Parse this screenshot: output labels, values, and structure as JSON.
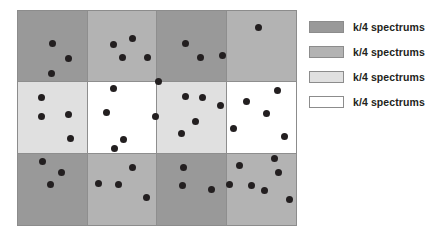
{
  "figure": {
    "name": "spectrum-partition-grid",
    "dot_color": "#231f20",
    "border_color": "#8c8c8c"
  },
  "palette": {
    "dark_gray": "#999999",
    "medium_gray": "#b3b3b3",
    "light_gray": "#e0e0e0",
    "white": "#ffffff"
  },
  "legend": {
    "items": [
      {
        "label": "k/4 spectrums",
        "color": "#999999",
        "swatch_name": "dark-gray-swatch"
      },
      {
        "label": "k/4 spectrums",
        "color": "#b3b3b3",
        "swatch_name": "medium-gray-swatch"
      },
      {
        "label": "k/4 spectrums",
        "color": "#e0e0e0",
        "swatch_name": "light-gray-swatch"
      },
      {
        "label": "k/4 spectrums",
        "color": "#ffffff",
        "swatch_name": "white-swatch"
      }
    ]
  },
  "chart_data": {
    "type": "scatter",
    "title": "",
    "xlabel": "",
    "ylabel": "",
    "grid": true,
    "legend_position": "right",
    "rows": 3,
    "cols": 4,
    "xlim": [
      0,
      280
    ],
    "ylim": [
      0,
      216
    ],
    "cell_fills": [
      [
        "#999999",
        "#b3b3b3",
        "#999999",
        "#b3b3b3"
      ],
      [
        "#e0e0e0",
        "#ffffff",
        "#e0e0e0",
        "#ffffff"
      ],
      [
        "#999999",
        "#b3b3b3",
        "#999999",
        "#b3b3b3"
      ]
    ],
    "cell_dot_counts": [
      [
        3,
        5,
        3,
        1
      ],
      [
        4,
        4,
        5,
        5
      ],
      [
        3,
        5,
        3,
        7
      ]
    ],
    "total_dots": 48,
    "points": [
      [
        34,
        32
      ],
      [
        50,
        47
      ],
      [
        33,
        62
      ],
      [
        95,
        33
      ],
      [
        114,
        27
      ],
      [
        104,
        46
      ],
      [
        129,
        46
      ],
      [
        140,
        70
      ],
      [
        167,
        32
      ],
      [
        182,
        46
      ],
      [
        204,
        44
      ],
      [
        240,
        16
      ],
      [
        23,
        86
      ],
      [
        23,
        105
      ],
      [
        50,
        103
      ],
      [
        52,
        127
      ],
      [
        95,
        77
      ],
      [
        88,
        101
      ],
      [
        137,
        105
      ],
      [
        105,
        128
      ],
      [
        167,
        85
      ],
      [
        184,
        86
      ],
      [
        202,
        94
      ],
      [
        177,
        110
      ],
      [
        163,
        122
      ],
      [
        228,
        90
      ],
      [
        259,
        79
      ],
      [
        248,
        102
      ],
      [
        215,
        117
      ],
      [
        266,
        125
      ],
      [
        24,
        150
      ],
      [
        43,
        161
      ],
      [
        32,
        173
      ],
      [
        96,
        137
      ],
      [
        114,
        156
      ],
      [
        80,
        172
      ],
      [
        100,
        173
      ],
      [
        128,
        186
      ],
      [
        165,
        156
      ],
      [
        164,
        174
      ],
      [
        193,
        178
      ],
      [
        221,
        154
      ],
      [
        256,
        147
      ],
      [
        260,
        161
      ],
      [
        211,
        173
      ],
      [
        233,
        174
      ],
      [
        246,
        179
      ],
      [
        271,
        188
      ]
    ]
  }
}
